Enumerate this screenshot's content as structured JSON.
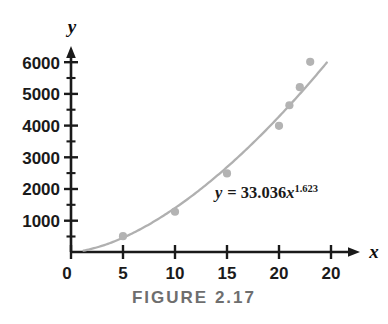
{
  "figure": {
    "caption": "FIGURE 2.17",
    "x_axis_name": "x",
    "y_axis_name": "y",
    "equation_lhs": "y",
    "equation_eq": "= 33.036",
    "equation_var": "x",
    "equation_exponent": "1.623"
  },
  "chart_data": {
    "type": "scatter",
    "title": "FIGURE 2.17",
    "xlabel": "x",
    "ylabel": "y",
    "annotations": [
      {
        "text": "y = 33.036x^1.623",
        "x": 16.5,
        "y": 1800,
        "kind": "fit-equation"
      }
    ],
    "grid": false,
    "legend": null,
    "xlim": [
      0,
      26
    ],
    "ylim": [
      0,
      6400
    ],
    "x_ticks": [
      0,
      5,
      10,
      15,
      20,
      25
    ],
    "x_tick_labels": [
      "0",
      "5",
      "10",
      "15",
      "20",
      "20"
    ],
    "y_ticks": [
      1000,
      2000,
      3000,
      4000,
      5000,
      6000
    ],
    "y_tick_labels": [
      "1000",
      "2000",
      "3000",
      "4000",
      "5000",
      "6000"
    ],
    "y_minor_ticks": [
      500,
      1500,
      2500,
      3500,
      4500,
      5500,
      6000
    ],
    "series": [
      {
        "name": "observed data",
        "type": "scatter",
        "marker": "circle",
        "color": "#b3b3b3",
        "points": [
          {
            "x": 5,
            "y": 500
          },
          {
            "x": 10,
            "y": 1270
          },
          {
            "x": 15,
            "y": 2480
          },
          {
            "x": 20,
            "y": 3980
          },
          {
            "x": 21,
            "y": 4630
          },
          {
            "x": 22,
            "y": 5200
          },
          {
            "x": 23,
            "y": 6000
          }
        ]
      },
      {
        "name": "power fit",
        "type": "line",
        "color": "#b0b0b0",
        "formula": "y = 33.036 * x^1.623",
        "coefficient": 33.036,
        "exponent": 1.623,
        "x_range": [
          1.2,
          24.6
        ]
      }
    ],
    "colors": {
      "marker": "#b3b3b3",
      "curve": "#b0b0b0",
      "axis": "#1a1a1a",
      "caption": "#6e6e6e",
      "background": "#ffffff"
    }
  }
}
